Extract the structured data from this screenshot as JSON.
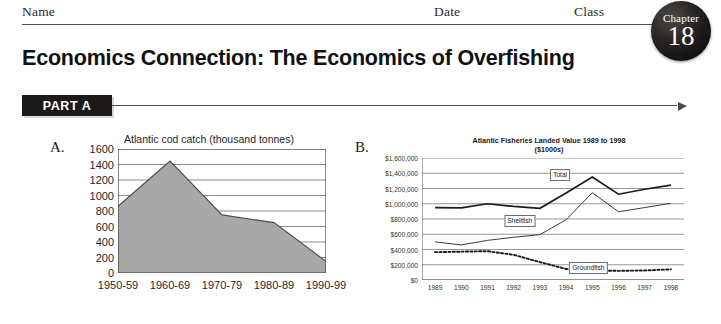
{
  "header": {
    "name_label": "Name",
    "date_label": "Date",
    "class_label": "Class"
  },
  "chapter_badge": {
    "word": "Chapter",
    "number": "18"
  },
  "page_title": "Economics Connection: The Economics of Overfishing",
  "part_banner": {
    "label": "PART A"
  },
  "panels": {
    "a_label": "A.",
    "b_label": "B."
  },
  "colors": {
    "ink": "#1a1a1a",
    "rule": "#4d4d4d",
    "banner_bg": "#1c1a19",
    "area_fill": "#a8a8a8",
    "area_stroke": "#4a4a4a",
    "gridline": "#8c8c8c",
    "total_line": "#1a1a1a",
    "shellfish_line": "#3d3d3d",
    "groundfish_line": "#1a1a1a"
  },
  "chart_data": [
    {
      "id": "chart-a",
      "type": "area",
      "title": "Atlantic cod catch (thousand tonnes)",
      "xlabel": "",
      "ylabel": "",
      "categories": [
        "1950-59",
        "1960-69",
        "1970-79",
        "1980-89",
        "1990-99"
      ],
      "values": [
        860,
        1445,
        750,
        650,
        150
      ],
      "ylim": [
        0,
        1600
      ],
      "ytick_step": 200,
      "yticks": [
        1600,
        1400,
        1200,
        1000,
        800,
        600,
        400,
        200,
        0
      ],
      "ytick_labels": [
        "1600",
        "1400",
        "1200",
        "1000",
        "800",
        "600",
        "400",
        "200",
        "0"
      ],
      "grid": true,
      "legend": "none"
    },
    {
      "id": "chart-b",
      "type": "line",
      "title": "Atlantic Fisheries Landed Value 1989 to 1998",
      "subtitle": "($1000s)",
      "xlabel": "",
      "ylabel": "",
      "categories": [
        "1989",
        "1990",
        "1991",
        "1992",
        "1993",
        "1994",
        "1995",
        "1996",
        "1997",
        "1998"
      ],
      "ylim": [
        0,
        1600000
      ],
      "ytick_step": 200000,
      "yticks": [
        1600000,
        1400000,
        1200000,
        1000000,
        800000,
        600000,
        400000,
        200000,
        0
      ],
      "ytick_labels": [
        "$1,600,000",
        "$1,400,000",
        "$1,200,000",
        "$1,000,000",
        "$800,000",
        "$600,000",
        "$400,000",
        "$200,000",
        "$0"
      ],
      "grid": true,
      "legend": "inline-callouts",
      "series": [
        {
          "name": "Total",
          "style": "solid-thick",
          "values": [
            950000,
            945000,
            1000000,
            965000,
            940000,
            1140000,
            1350000,
            1125000,
            1190000,
            1245000
          ]
        },
        {
          "name": "Shellfish",
          "style": "solid-thin",
          "values": [
            500000,
            460000,
            520000,
            560000,
            595000,
            790000,
            1145000,
            895000,
            950000,
            1005000
          ]
        },
        {
          "name": "Groundfish",
          "style": "dotted",
          "values": [
            365000,
            372000,
            378000,
            330000,
            235000,
            145000,
            125000,
            120000,
            125000,
            140000
          ]
        }
      ]
    }
  ]
}
